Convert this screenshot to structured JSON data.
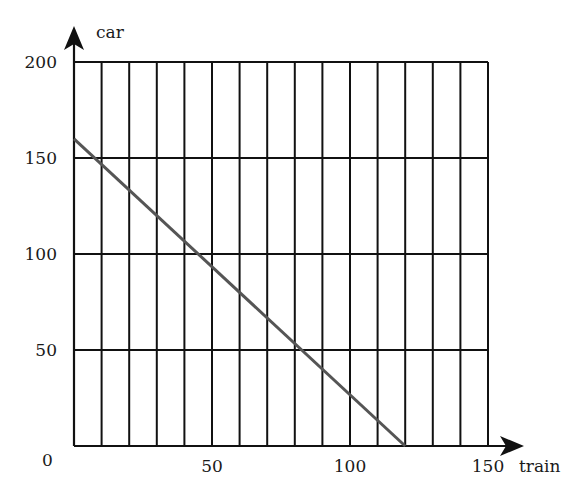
{
  "chart_data": {
    "type": "line",
    "title": "",
    "xlabel": "train",
    "ylabel": "car",
    "xlim": [
      0,
      150
    ],
    "ylim": [
      0,
      200
    ],
    "x_ticks": [
      0,
      50,
      100,
      150
    ],
    "y_ticks": [
      0,
      50,
      100,
      150,
      200
    ],
    "x_tick_labels": [
      "50",
      "100",
      "150"
    ],
    "y_tick_labels": [
      "50",
      "100",
      "150",
      "200"
    ],
    "origin_label": "0",
    "grid": {
      "vertical_every": 10,
      "horizontal_every": 50
    },
    "series": [
      {
        "name": "constraint line",
        "x": [
          0,
          120
        ],
        "y": [
          160,
          0
        ],
        "color": "#555555"
      }
    ],
    "legend": null
  },
  "colors": {
    "grid": "#111111",
    "line": "#555555",
    "text": "#1a1a1a",
    "background": "#ffffff"
  }
}
